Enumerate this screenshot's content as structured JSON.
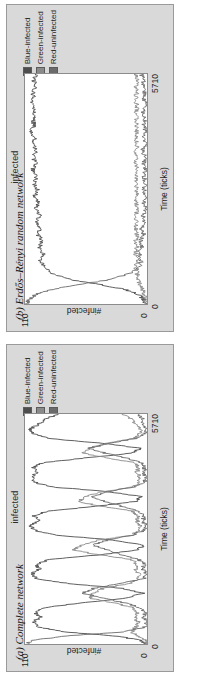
{
  "figure": {
    "orientation": "rotated-90-ccw",
    "background": "#ffffff",
    "panel_background": "#d9d9d9",
    "plot_area_background": "#ffffff"
  },
  "panels": [
    {
      "id": "panel-b",
      "caption": "(b) Erdős–Rényi random network",
      "chart_data": {
        "type": "line",
        "title": "infected",
        "xlabel": "Time (ticks)",
        "ylabel": "#infected",
        "xlim": [
          0,
          5710
        ],
        "ylim": [
          0,
          110
        ],
        "xticks": [
          "0",
          "5710"
        ],
        "yticks": [
          "0",
          "110"
        ],
        "grid": false,
        "legend_position": "top-right",
        "series": [
          {
            "name": "Blue-infected",
            "color": "#4d4d4d",
            "x": [
              0,
              120,
              240,
              360,
              480,
              600,
              760,
              920,
              1080,
              1240,
              1400,
              1560,
              1720,
              1880,
              2040,
              2200,
              2360,
              2520,
              2680,
              2840,
              3000,
              3160,
              3320,
              3480,
              3640,
              3800,
              3960,
              4120,
              4280,
              4440,
              4600,
              4760,
              4920,
              5080,
              5240,
              5400,
              5560,
              5710
            ],
            "values": [
              1,
              3,
              8,
              20,
              42,
              68,
              86,
              93,
              96,
              94,
              97,
              95,
              98,
              96,
              99,
              97,
              100,
              98,
              101,
              99,
              102,
              100,
              103,
              101,
              102,
              100,
              103,
              101,
              104,
              102,
              103,
              101,
              104,
              102,
              103,
              101,
              102,
              100
            ]
          },
          {
            "name": "Green-infected",
            "color": "#8a8a8a",
            "x": [
              0,
              120,
              240,
              360,
              480,
              600,
              760,
              920,
              1080,
              1240,
              1400,
              1560,
              1720,
              1880,
              2040,
              2200,
              2360,
              2520,
              2680,
              2840,
              3000,
              3160,
              3320,
              3480,
              3640,
              3800,
              3960,
              4120,
              4280,
              4440,
              4600,
              4760,
              4920,
              5080,
              5240,
              5400,
              5560,
              5710
            ],
            "values": [
              0,
              1,
              2,
              4,
              6,
              8,
              9,
              10,
              9,
              10,
              9,
              10,
              9,
              10,
              9,
              10,
              9,
              10,
              9,
              10,
              9,
              10,
              9,
              10,
              9,
              10,
              9,
              10,
              9,
              10,
              9,
              10,
              9,
              10,
              9,
              10,
              9,
              10
            ]
          },
          {
            "name": "Red-uninfected",
            "color": "#6b6b6b",
            "x": [
              0,
              120,
              240,
              360,
              480,
              600,
              760,
              920,
              1080,
              1240,
              1400,
              1560,
              1720,
              1880,
              2040,
              2200,
              2360,
              2520,
              2680,
              2840,
              3000,
              3160,
              3320,
              3480,
              3640,
              3800,
              3960,
              4120,
              4280,
              4440,
              4600,
              4760,
              4920,
              5080,
              5240,
              5400,
              5560,
              5710
            ],
            "values": [
              109,
              106,
              100,
              86,
              62,
              34,
              15,
              7,
              5,
              7,
              4,
              6,
              3,
              5,
              2,
              4,
              1,
              3,
              1,
              3,
              1,
              3,
              1,
              3,
              2,
              4,
              1,
              3,
              1,
              3,
              2,
              4,
              1,
              3,
              2,
              4,
              3,
              5
            ]
          }
        ]
      }
    },
    {
      "id": "panel-a",
      "caption": "(a) Complete network",
      "chart_data": {
        "type": "line",
        "title": "infected",
        "xlabel": "Time (ticks)",
        "ylabel": "#infected",
        "xlim": [
          0,
          5710
        ],
        "ylim": [
          0,
          110
        ],
        "xticks": [
          "0",
          "5710"
        ],
        "yticks": [
          "0",
          "110"
        ],
        "grid": false,
        "legend_position": "top-right",
        "series": [
          {
            "name": "Blue-infected",
            "color": "#4d4d4d",
            "x": [
              0,
              100,
              200,
              300,
              420,
              540,
              660,
              780,
              900,
              1020,
              1140,
              1260,
              1380,
              1500,
              1620,
              1740,
              1860,
              1980,
              2100,
              2220,
              2340,
              2460,
              2580,
              2700,
              2820,
              2940,
              3060,
              3180,
              3300,
              3420,
              3540,
              3660,
              3780,
              3900,
              4020,
              4140,
              4260,
              4380,
              4500,
              4620,
              4740,
              4860,
              4980,
              5100,
              5220,
              5340,
              5460,
              5580,
              5710
            ],
            "values": [
              1,
              6,
              30,
              75,
              98,
              103,
              96,
              101,
              92,
              60,
              18,
              4,
              22,
              70,
              99,
              104,
              97,
              100,
              88,
              40,
              8,
              3,
              30,
              82,
              101,
              105,
              98,
              102,
              90,
              45,
              10,
              5,
              35,
              86,
              102,
              104,
              99,
              103,
              94,
              55,
              14,
              6,
              38,
              88,
              103,
              105,
              97,
              92,
              80
            ]
          },
          {
            "name": "Green-infected",
            "color": "#8a8a8a",
            "x": [
              0,
              100,
              200,
              300,
              420,
              540,
              660,
              780,
              900,
              1020,
              1140,
              1260,
              1380,
              1500,
              1620,
              1740,
              1860,
              1980,
              2100,
              2220,
              2340,
              2460,
              2580,
              2700,
              2820,
              2940,
              3060,
              3180,
              3300,
              3420,
              3540,
              3660,
              3780,
              3900,
              4020,
              4140,
              4260,
              4380,
              4500,
              4620,
              4740,
              4860,
              4980,
              5100,
              5220,
              5340,
              5460,
              5580,
              5710
            ],
            "values": [
              0,
              2,
              8,
              14,
              10,
              8,
              11,
              9,
              12,
              30,
              52,
              48,
              40,
              16,
              8,
              7,
              10,
              9,
              14,
              45,
              66,
              58,
              44,
              14,
              8,
              6,
              9,
              8,
              13,
              42,
              62,
              55,
              40,
              12,
              7,
              6,
              9,
              8,
              11,
              36,
              58,
              52,
              38,
              11,
              7,
              6,
              10,
              14,
              22
            ]
          },
          {
            "name": "Red-uninfected",
            "color": "#6b6b6b",
            "x": [
              0,
              100,
              200,
              300,
              420,
              540,
              660,
              780,
              900,
              1020,
              1140,
              1260,
              1380,
              1500,
              1620,
              1740,
              1860,
              1980,
              2100,
              2220,
              2340,
              2460,
              2580,
              2700,
              2820,
              2940,
              3060,
              3180,
              3300,
              3420,
              3540,
              3660,
              3780,
              3900,
              4020,
              4140,
              4260,
              4380,
              4500,
              4620,
              4740,
              4860,
              4980,
              5100,
              5220,
              5340,
              5460,
              5580,
              5710
            ],
            "values": [
              109,
              102,
              72,
              21,
              2,
              0,
              3,
              1,
              6,
              20,
              40,
              58,
              48,
              24,
              3,
              1,
              4,
              2,
              8,
              25,
              36,
              49,
              36,
              14,
              2,
              1,
              4,
              2,
              7,
              23,
              38,
              50,
              35,
              12,
              2,
              1,
              3,
              2,
              5,
              19,
              38,
              52,
              34,
              11,
              1,
              0,
              3,
              4,
              8
            ]
          }
        ]
      }
    }
  ],
  "legend": {
    "items": [
      {
        "label": "Blue-infected",
        "color": "#4d4d4d"
      },
      {
        "label": "Green-infected",
        "color": "#8a8a8a"
      },
      {
        "label": "Red-uninfected",
        "color": "#6b6b6b"
      }
    ]
  }
}
